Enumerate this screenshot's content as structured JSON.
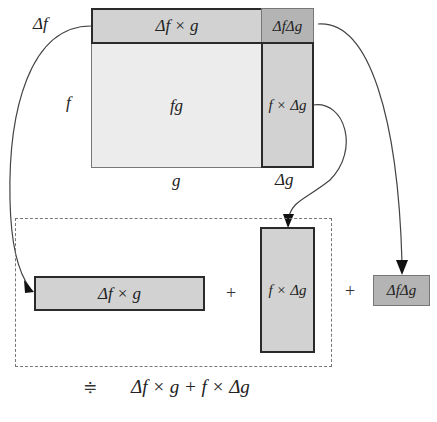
{
  "diagram": {
    "top_figure": {
      "side_labels": {
        "delta_f": "Δf",
        "f": "f",
        "g": "g",
        "delta_g": "Δg"
      },
      "regions": {
        "delta_f_times_g": "Δf × g",
        "fg": "fg",
        "delta_f_delta_g": "ΔfΔg",
        "f_times_delta_g": "f × Δg"
      }
    },
    "bottom_row": {
      "term1": "Δf × g",
      "plus1": "+",
      "term2": "f × Δg",
      "plus2": "+",
      "term3": "ΔfΔg"
    },
    "approximation": {
      "symbol": "≑",
      "expression": "Δf × g + f × Δg"
    },
    "colors": {
      "light_region": "#ececec",
      "mid_region": "#d2d2d2",
      "dark_region": "#b4b4b4",
      "stroke": "#2a2a2a"
    }
  }
}
